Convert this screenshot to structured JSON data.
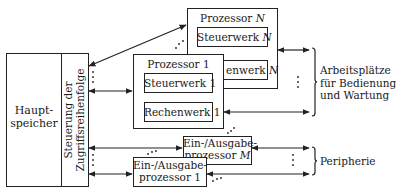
{
  "memory": {
    "label_line1": "Haupt-",
    "label_line2": "speicher",
    "access_control_line1": "Steuerung der",
    "access_control_line2": "Zugriffsreihenfolge"
  },
  "processor_n": {
    "title": "Prozessor",
    "index": "N",
    "control_unit": "Steuerwerk",
    "arith_unit_visible": "enwerk"
  },
  "processor_1": {
    "title": "Prozessor 1",
    "control_unit": "Steuerwerk 1",
    "arith_unit": "Rechenwerk 1"
  },
  "io_m": {
    "line1": "Ein-/Ausgabe-",
    "line2": "prozessor",
    "index": "M"
  },
  "io_1": {
    "line1": "Ein-/Ausgabe-",
    "line2": "prozessor 1"
  },
  "workstations": {
    "line1": "Arbeitsplätze",
    "line2": "für Bedienung",
    "line3": "und Wartung"
  },
  "peripherals": {
    "label": "Peripherie"
  },
  "ellipsis": "⋮"
}
